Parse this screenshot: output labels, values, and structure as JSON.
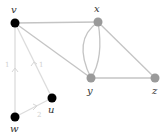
{
  "graph": {
    "nodes": [
      {
        "id": "v",
        "label": "v",
        "x": 15,
        "y": 23,
        "color": "#000000"
      },
      {
        "id": "x",
        "label": "x",
        "x": 98,
        "y": 22,
        "color": "#999999"
      },
      {
        "id": "y",
        "label": "y",
        "x": 91,
        "y": 78,
        "color": "#999999"
      },
      {
        "id": "z",
        "label": "z",
        "x": 155,
        "y": 78,
        "color": "#999999"
      },
      {
        "id": "u",
        "label": "u",
        "x": 52,
        "y": 98,
        "color": "#000000"
      },
      {
        "id": "w",
        "label": "w",
        "x": 15,
        "y": 117,
        "color": "#000000"
      }
    ],
    "edges": [
      {
        "from": "v",
        "to": "x"
      },
      {
        "from": "v",
        "to": "y"
      },
      {
        "from": "x",
        "to": "y",
        "curve": "left"
      },
      {
        "from": "x",
        "to": "y",
        "curve": "right"
      },
      {
        "from": "x",
        "to": "z"
      },
      {
        "from": "y",
        "to": "z"
      },
      {
        "from": "w",
        "to": "v",
        "label": "1",
        "directed": true
      },
      {
        "from": "u",
        "to": "v",
        "label": "1",
        "directed": true
      },
      {
        "from": "w",
        "to": "u",
        "label": "2",
        "directed": true
      }
    ],
    "edge_labels": {
      "wv": "1",
      "uv": "1",
      "wu": "2"
    }
  }
}
